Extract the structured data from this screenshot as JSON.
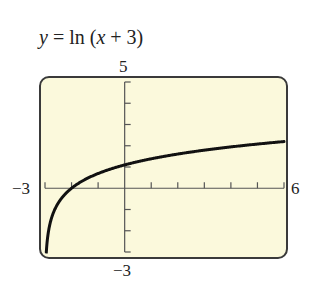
{
  "title": {
    "y": "y",
    "eq": " = ln (",
    "x": "x",
    "rest": " + 3)"
  },
  "labels": {
    "ymax": "5",
    "ymin": "−3",
    "xmin": "−3",
    "xmax": "6"
  },
  "colors": {
    "screen_bg": "#fbf9dc",
    "frame": "#3a3a3a",
    "axis": "#555555",
    "curve": "#111111"
  },
  "chart_data": {
    "type": "line",
    "title": "y = ln (x + 3)",
    "function": "ln(x + 3)",
    "xlabel": "",
    "ylabel": "",
    "xlim": [
      -3,
      6
    ],
    "ylim": [
      -3,
      5
    ],
    "xscale_ticks": 1,
    "yscale_ticks": 1,
    "x_tick_labels": [
      "-3",
      "6"
    ],
    "y_tick_labels": [
      "-3",
      "5"
    ],
    "grid": false,
    "legend": null,
    "series": [
      {
        "name": "y = ln(x + 3)",
        "x": [
          -2.95,
          -2.9,
          -2.8,
          -2.6,
          -2.3,
          -2,
          -1.5,
          -1,
          0,
          1,
          2,
          3,
          4,
          5,
          6
        ],
        "y": [
          -3.0,
          -2.3,
          -1.61,
          -0.92,
          -0.36,
          0,
          0.41,
          0.69,
          1.1,
          1.39,
          1.61,
          1.79,
          1.95,
          2.08,
          2.2
        ]
      }
    ]
  }
}
